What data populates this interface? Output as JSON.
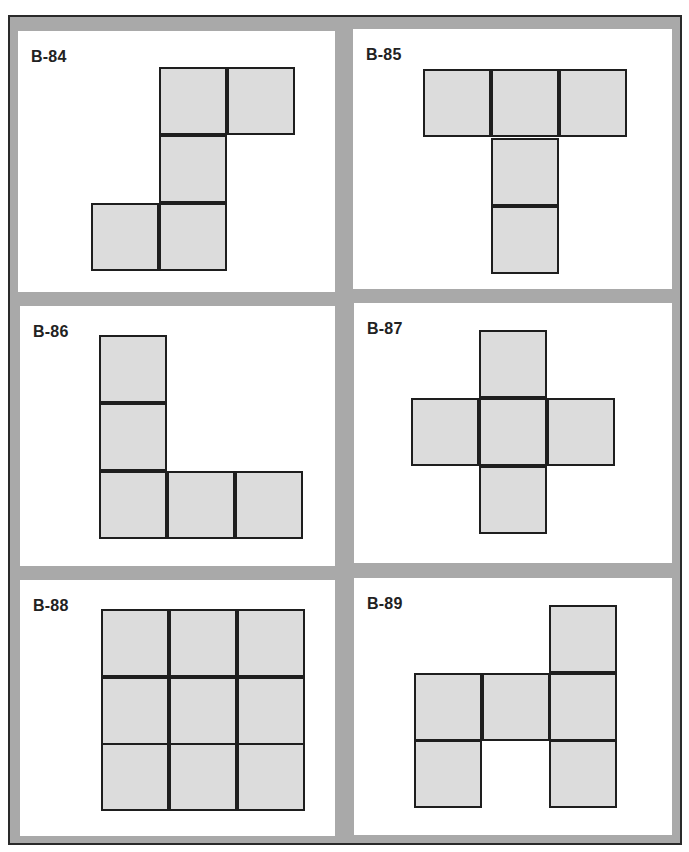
{
  "page": {
    "colors": {
      "frame": "#a9a9a9",
      "panel": "#ffffff",
      "square_fill": "#dcdcdc",
      "square_border": "#1e1e1e",
      "label": "#222222"
    }
  },
  "panels": [
    {
      "label": "B-84",
      "squares": [
        [
          159,
          67
        ],
        [
          227,
          67
        ],
        [
          159,
          135
        ],
        [
          91,
          203
        ],
        [
          159,
          203
        ]
      ]
    },
    {
      "label": "B-85",
      "squares": [
        [
          423,
          69
        ],
        [
          491,
          69
        ],
        [
          559,
          69
        ],
        [
          491,
          138
        ],
        [
          491,
          206
        ]
      ]
    },
    {
      "label": "B-86",
      "squares": [
        [
          99,
          335
        ],
        [
          99,
          403
        ],
        [
          99,
          471
        ],
        [
          167,
          471
        ],
        [
          235,
          471
        ]
      ]
    },
    {
      "label": "B-87",
      "squares": [
        [
          479,
          330
        ],
        [
          411,
          398
        ],
        [
          479,
          398
        ],
        [
          547,
          398
        ],
        [
          479,
          466
        ]
      ]
    },
    {
      "label": "B-88",
      "squares": [
        [
          101,
          609
        ],
        [
          169,
          609
        ],
        [
          237,
          609
        ],
        [
          101,
          677
        ],
        [
          169,
          677
        ],
        [
          237,
          677
        ],
        [
          101,
          743
        ],
        [
          169,
          743
        ],
        [
          237,
          743
        ]
      ]
    },
    {
      "label": "B-89",
      "squares": [
        [
          549,
          605
        ],
        [
          414,
          673
        ],
        [
          482,
          673
        ],
        [
          549,
          673
        ],
        [
          414,
          740
        ],
        [
          549,
          740
        ]
      ]
    }
  ]
}
